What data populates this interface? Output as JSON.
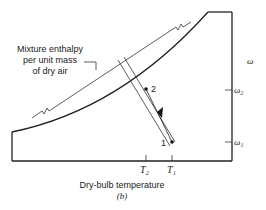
{
  "diagram": {
    "type": "psychrometric-chart-schematic",
    "annotation": {
      "line1": "Mixture enthalpy",
      "line2": "per unit mass",
      "line3": "of dry air"
    },
    "axes": {
      "x_label": "Dry-bulb temperature",
      "y_label": "ω",
      "x_ticks": [
        "T₂",
        "T₁"
      ],
      "y_ticks": [
        "ω₂",
        "ω₁"
      ]
    },
    "points": [
      {
        "label": "1"
      },
      {
        "label": "2"
      }
    ],
    "caption": "(b)"
  }
}
